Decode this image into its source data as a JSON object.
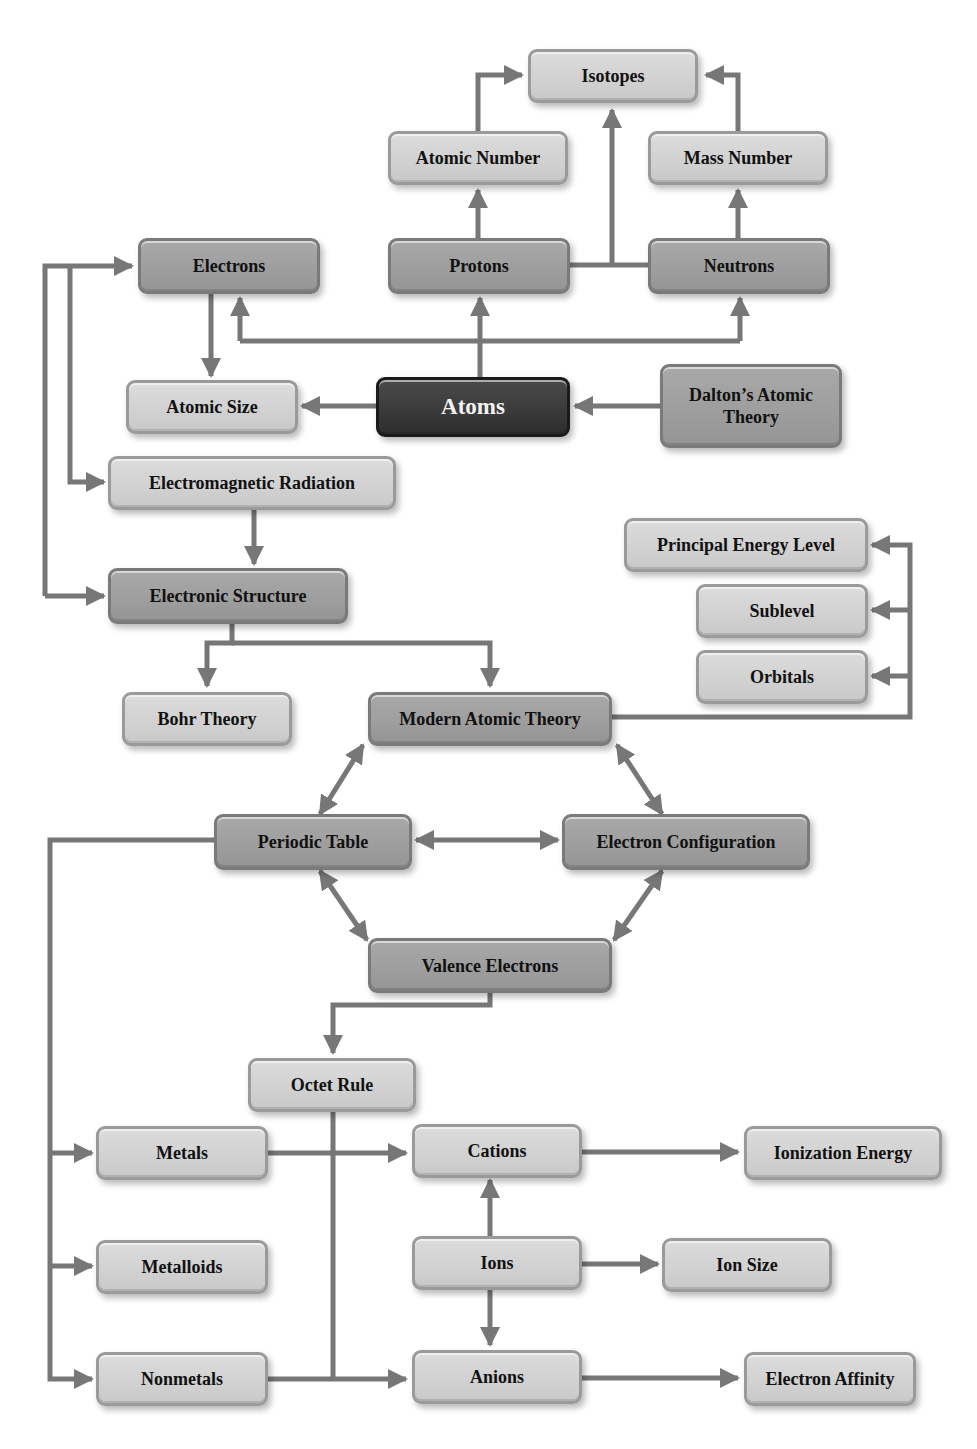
{
  "diagram": {
    "type": "concept-map",
    "colors": {
      "connector": "#777777",
      "node_light": "#d2d2d2",
      "node_medium": "#a0a0a0",
      "node_root": "#3a3a3a",
      "root_text": "#f2f2f2",
      "text": "#111111"
    },
    "nodes": {
      "isotopes": "Isotopes",
      "atomic_number": "Atomic Number",
      "mass_number": "Mass Number",
      "electrons": "Electrons",
      "protons": "Protons",
      "neutrons": "Neutrons",
      "atomic_size": "Atomic Size",
      "atoms": "Atoms",
      "daltons_theory": "Dalton’s Atomic Theory",
      "em_radiation": "Electromagnetic Radiation",
      "principal_energy_level": "Principal Energy Level",
      "sublevel": "Sublevel",
      "orbitals": "Orbitals",
      "electronic_structure": "Electronic Structure",
      "bohr_theory": "Bohr Theory",
      "modern_atomic_theory": "Modern Atomic Theory",
      "periodic_table": "Periodic Table",
      "electron_configuration": "Electron Configuration",
      "valence_electrons": "Valence Electrons",
      "octet_rule": "Octet Rule",
      "metals": "Metals",
      "cations": "Cations",
      "ionization_energy": "Ionization Energy",
      "metalloids": "Metalloids",
      "ions": "Ions",
      "ion_size": "Ion Size",
      "nonmetals": "Nonmetals",
      "anions": "Anions",
      "electron_affinity": "Electron Affinity"
    },
    "edges": [
      {
        "from": "Atoms",
        "to": "Protons"
      },
      {
        "from": "Atoms",
        "to": "Electrons"
      },
      {
        "from": "Atoms",
        "to": "Neutrons"
      },
      {
        "from": "Atoms",
        "to": "Atomic Size"
      },
      {
        "from": "Dalton’s Atomic Theory",
        "to": "Atoms"
      },
      {
        "from": "Protons",
        "to": "Atomic Number"
      },
      {
        "from": "Neutrons",
        "to": "Mass Number"
      },
      {
        "from": "Atomic Number",
        "to": "Isotopes"
      },
      {
        "from": "Mass Number",
        "to": "Isotopes"
      },
      {
        "from": "Protons + Neutrons",
        "to": "Isotopes"
      },
      {
        "from": "Electrons",
        "to": "Atomic Size"
      },
      {
        "from": "Electrons",
        "to": "Electromagnetic Radiation",
        "bidirectional": true
      },
      {
        "from": "Electrons",
        "to": "Electronic Structure",
        "bidirectional": true
      },
      {
        "from": "Electromagnetic Radiation",
        "to": "Electronic Structure"
      },
      {
        "from": "Electronic Structure",
        "to": "Bohr Theory"
      },
      {
        "from": "Electronic Structure",
        "to": "Modern Atomic Theory"
      },
      {
        "from": "Modern Atomic Theory",
        "to": "Principal Energy Level"
      },
      {
        "from": "Modern Atomic Theory",
        "to": "Sublevel"
      },
      {
        "from": "Modern Atomic Theory",
        "to": "Orbitals"
      },
      {
        "from": "Modern Atomic Theory",
        "to": "Periodic Table",
        "bidirectional": true
      },
      {
        "from": "Modern Atomic Theory",
        "to": "Electron Configuration",
        "bidirectional": true
      },
      {
        "from": "Periodic Table",
        "to": "Electron Configuration",
        "bidirectional": true
      },
      {
        "from": "Periodic Table",
        "to": "Valence Electrons",
        "bidirectional": true
      },
      {
        "from": "Electron Configuration",
        "to": "Valence Electrons",
        "bidirectional": true
      },
      {
        "from": "Valence Electrons",
        "to": "Octet Rule"
      },
      {
        "from": "Periodic Table",
        "to": "Metals"
      },
      {
        "from": "Periodic Table",
        "to": "Metalloids"
      },
      {
        "from": "Periodic Table",
        "to": "Nonmetals"
      },
      {
        "from": "Metals",
        "to": "Cations"
      },
      {
        "from": "Octet Rule",
        "to": "Anions"
      },
      {
        "from": "Nonmetals",
        "to": "Anions"
      },
      {
        "from": "Ions",
        "to": "Cations"
      },
      {
        "from": "Ions",
        "to": "Anions"
      },
      {
        "from": "Ions",
        "to": "Ion Size"
      },
      {
        "from": "Cations",
        "to": "Ionization Energy"
      },
      {
        "from": "Anions",
        "to": "Electron Affinity"
      }
    ]
  }
}
